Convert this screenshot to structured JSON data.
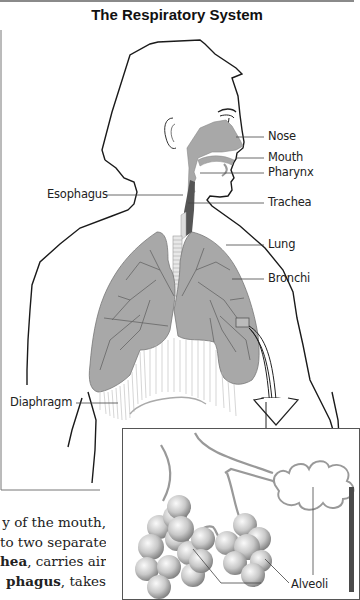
{
  "figure": {
    "title": "The Respiratory System",
    "labels": {
      "nose": "Nose",
      "mouth": "Mouth",
      "pharynx": "Pharynx",
      "esophagus": "Esophagus",
      "trachea": "Trachea",
      "lung": "Lung",
      "bronchi": "Bronchi",
      "diaphragm": "Diaphragm",
      "alveoli": "Alveoli"
    },
    "colors": {
      "organ_fill": "#a8a8a8",
      "outline": "#1a1a1a",
      "label_line": "#444444"
    }
  },
  "body_text": {
    "lines": [
      {
        "pre": "y of the mouth,",
        "bold": "",
        "post": ""
      },
      {
        "pre": "to two separate",
        "bold": "",
        "post": ""
      },
      {
        "pre": "",
        "bold": "hea",
        "post": ", carries air"
      },
      {
        "pre": "",
        "bold": "phagus",
        "post": ",  takes"
      }
    ]
  }
}
